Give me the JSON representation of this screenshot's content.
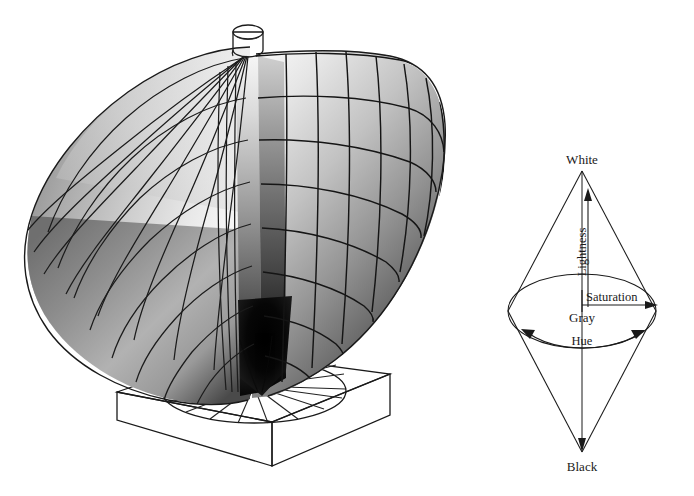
{
  "figure": {
    "name": "color-solid-and-hsl-bicone",
    "background_color": "#ffffff",
    "width": 694,
    "height": 496,
    "panels": [
      {
        "id": "color-solid",
        "title": "",
        "description": "Three-dimensional psychological color solid with curved mesh surface mounted on a square plinth with a radial hue disc"
      },
      {
        "id": "hsl-bicone",
        "title": "",
        "description": "Double-cone (bicone) schematic of the HSL color space"
      }
    ]
  },
  "bicone": {
    "labels": {
      "white": "White",
      "black": "Black",
      "gray": "Gray",
      "lightness": "Lightness",
      "saturation": "Saturation",
      "hue": "Hue"
    },
    "geometry": {
      "apex_top": [
        582,
        171
      ],
      "apex_bottom": [
        582,
        452
      ],
      "equator_center": [
        582,
        311
      ],
      "equator_rx": 74,
      "equator_ry": 37
    },
    "colors": {
      "stroke": "#1a1a1a",
      "text": "#1a1a1a"
    }
  },
  "color_solid": {
    "parts": {
      "cylinder": "white-cylinder-cap",
      "plinth": "square-base-plinth",
      "hue_disc": "radial-hue-disc",
      "mesh": "curved-grid-surface"
    },
    "shading": {
      "lightest": "#f2f2f2",
      "mid": "#9a9a9a",
      "darkest": "#050505"
    },
    "grid": {
      "meridians": 9,
      "parallels": 8,
      "fan_spokes": 18
    }
  }
}
